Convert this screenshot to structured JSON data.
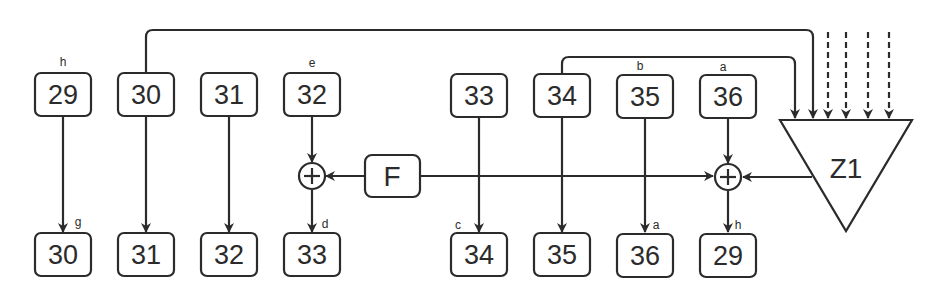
{
  "diagram": {
    "top_row": [
      {
        "value": "29",
        "label": "h",
        "x": 63
      },
      {
        "value": "30",
        "label": "",
        "x": 146
      },
      {
        "value": "31",
        "label": "",
        "x": 229
      },
      {
        "value": "32",
        "label": "e",
        "x": 312
      },
      {
        "value": "33",
        "label": "",
        "x": 479
      },
      {
        "value": "34",
        "label": "",
        "x": 562
      },
      {
        "value": "35",
        "label": "b",
        "x": 645
      },
      {
        "value": "36",
        "label": "a",
        "x": 728
      }
    ],
    "bottom_row": [
      {
        "value": "30",
        "label": "g",
        "x": 63
      },
      {
        "value": "31",
        "label": "",
        "x": 146
      },
      {
        "value": "32",
        "label": "",
        "x": 229
      },
      {
        "value": "33",
        "label": "d",
        "x": 312
      },
      {
        "value": "34",
        "label": "c",
        "x": 479
      },
      {
        "value": "35",
        "label": "",
        "x": 562
      },
      {
        "value": "36",
        "label": "a",
        "x": 645
      },
      {
        "value": "29",
        "label": "h",
        "x": 728
      }
    ],
    "function_block": "F",
    "triangle_block": "Z1",
    "adder_symbol": "+",
    "colors": {
      "stroke": "#2b2b2b",
      "background": "#ffffff"
    }
  }
}
